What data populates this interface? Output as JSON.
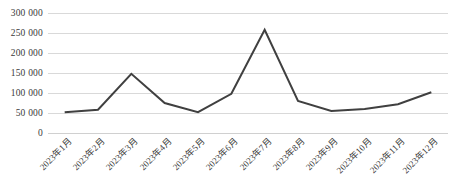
{
  "chart_data": {
    "type": "line",
    "title": "",
    "subtitle": "",
    "xlabel": "",
    "ylabel": "",
    "categories": [
      "2023年1月",
      "2023年2月",
      "2023年3月",
      "2023年4月",
      "2023年5月",
      "2023年6月",
      "2023年7月",
      "2023年8月",
      "2023年9月",
      "2023年10月",
      "2023年11月",
      "2023年12月"
    ],
    "values": [
      52000,
      58000,
      148000,
      75000,
      52000,
      98000,
      258000,
      80000,
      55000,
      60000,
      72000,
      102000
    ],
    "series": [
      {
        "name": "",
        "values": [
          52000,
          58000,
          148000,
          75000,
          52000,
          98000,
          258000,
          80000,
          55000,
          60000,
          72000,
          102000
        ],
        "color": "#404040"
      }
    ],
    "ylim": [
      0,
      300000
    ],
    "ytick_values": [
      0,
      50000,
      100000,
      150000,
      200000,
      250000,
      300000
    ],
    "ytick_labels": [
      "0",
      "50 000",
      "100 000",
      "150 000",
      "200 000",
      "250 000",
      "300 000"
    ],
    "grid": true,
    "grid_color": "#d9d9d9",
    "legend": false,
    "legend_position": "none",
    "line_color": "#404040",
    "line_width": 2,
    "markers": false,
    "background": "#ffffff"
  }
}
